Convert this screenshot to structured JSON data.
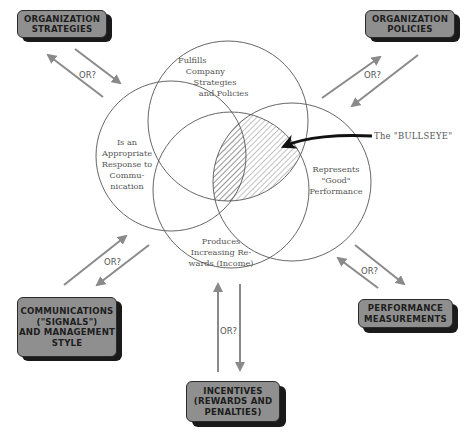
{
  "boxes": {
    "org_strategies": "ORGANIZATION\nSTRATEGIES",
    "org_policies": "ORGANIZATION\nPOLICIES",
    "communications": "COMMUNICATIONS\n(\"SIGNALS\")\nAND MANAGEMENT\nSTYLE",
    "performance": "PERFORMANCE\nMEASUREMENTS",
    "incentives": "INCENTIVES\n(REWARDS AND\nPENALTIES)"
  },
  "circles": {
    "top": "Fulfills\n   Company\n      Strategies\n        and Policies",
    "left": "Is an\nAppropriate\nResponse to\nCommu-\nnication",
    "right": "Represents\n\"Good\"\nPerformance",
    "bottom": "Produces\nIncreasing Re-\nwards (Income)"
  },
  "bullseye_label": "The \"BULLSEYE\"",
  "or_label": "OR?",
  "colors": {
    "box_fill": "#8f8f8f",
    "box_shadow": "#1a1a1a",
    "arrow": "#8a8a8a",
    "circle_stroke": "#555555",
    "bullseye_arrow": "#111111"
  }
}
